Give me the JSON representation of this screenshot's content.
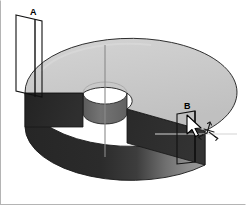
{
  "figure": {
    "type": "3d-solid-isometric",
    "object_name": "annular-sector-slab",
    "background_color": "#ffffff",
    "border_color": "#b4b4b4"
  },
  "annotations": {
    "label_a": "A",
    "label_b": "B"
  },
  "colors": {
    "top_face": "#c9c9c9",
    "top_face_highlight": "#d6d6d6",
    "front_rim_dark": "#2b2b2b",
    "right_rim_mid": "#8f8f8f",
    "inner_hole_wall": "#6e6e6e",
    "cut_face_left": "#2b2b2b",
    "cut_face_right": "#2b2b2b",
    "outline": "#1a1a1a",
    "axis_line": "#8a8a8a",
    "annotation_line": "#111111",
    "cursor_fill": "#ffffff",
    "cursor_stroke": "#000000"
  },
  "geometry": {
    "center_x": 104,
    "center_y": 92,
    "outer_radius_x": 106,
    "outer_radius_y": 54,
    "inner_radius_x": 22,
    "inner_radius_y": 11,
    "slab_thickness": 34,
    "sector_gap_degrees": 62
  },
  "icons": {
    "cursor": "mouse-pointer-icon",
    "rotate": "rotate-axis-icon"
  }
}
